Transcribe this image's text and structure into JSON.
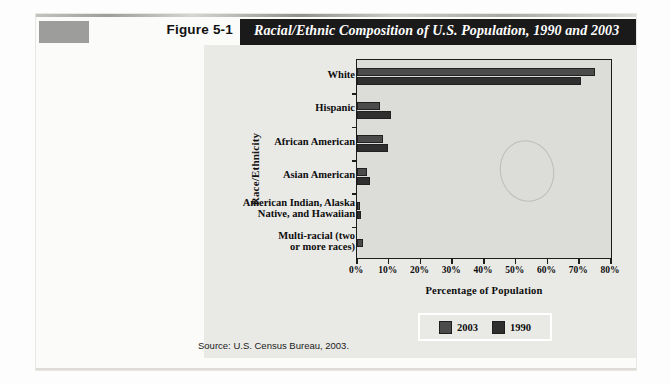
{
  "figure": {
    "number_label": "Figure 5-1",
    "title": "Racial/Ethnic Composition of U.S. Population, 1990 and 2003",
    "source": "Source: U.S. Census Bureau, 2003."
  },
  "legend": {
    "position": "bottom-center",
    "entries": [
      {
        "label": "2003",
        "color": "#4b4b4b"
      },
      {
        "label": "1990",
        "color": "#2f2f2f"
      }
    ]
  },
  "colors": {
    "title_bar": "#1a1a1a",
    "title_text": "#ffffff",
    "swatch": "#9d9d9b",
    "plot_background": "#dcdcd8",
    "chart_background": "#e9e9e6",
    "series_2003": "#4b4b4b",
    "series_1990": "#2f2f2f",
    "axis": "#1c1c1c"
  },
  "chart_data": {
    "type": "bar",
    "orientation": "horizontal",
    "title": "Racial/Ethnic Composition of U.S. Population, 1990 and 2003",
    "xlabel": "Percentage of Population",
    "ylabel": "Race/Ethnicity",
    "xlim": [
      0,
      80
    ],
    "xticks": [
      0,
      10,
      20,
      30,
      40,
      50,
      60,
      70,
      80
    ],
    "xticklabels": [
      "0%",
      "10%",
      "20%",
      "30%",
      "40%",
      "50%",
      "60%",
      "70%",
      "80%"
    ],
    "grid": false,
    "legend_position": "bottom-center",
    "categories": [
      "White",
      "Hispanic",
      "African American",
      "Asian American",
      "American Indian, Alaska Native, and Hawaiian",
      "Multi-racial (two or more races)"
    ],
    "category_lines": [
      [
        "White"
      ],
      [
        "Hispanic"
      ],
      [
        "African American"
      ],
      [
        "Asian American"
      ],
      [
        "American Indian, Alaska",
        "Native, and Hawaiian"
      ],
      [
        "Multi-racial (two",
        "or more races)"
      ]
    ],
    "series": [
      {
        "name": "2003",
        "color": "#4b4b4b",
        "values": [
          75.1,
          7.4,
          8.3,
          3.3,
          0.9,
          2.0
        ]
      },
      {
        "name": "1990",
        "color": "#2f2f2f",
        "values": [
          70.4,
          10.6,
          9.8,
          4.1,
          1.3,
          null
        ]
      }
    ]
  }
}
